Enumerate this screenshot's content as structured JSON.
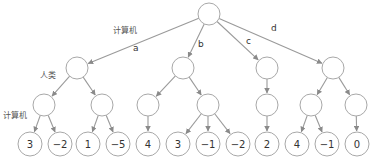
{
  "diagram": {
    "type": "game-tree",
    "level_labels": {
      "root_player": "计算机",
      "level1_player": "人类",
      "level2_player": "计算机"
    },
    "edge_labels": [
      "a",
      "b",
      "c",
      "d"
    ],
    "root": {
      "id": "root",
      "x": 209,
      "y": 14
    },
    "level1": [
      {
        "id": "n_a",
        "x": 77,
        "y": 68,
        "edge": "a"
      },
      {
        "id": "n_b",
        "x": 183,
        "y": 68,
        "edge": "b"
      },
      {
        "id": "n_c",
        "x": 267,
        "y": 68,
        "edge": "c"
      },
      {
        "id": "n_d",
        "x": 333,
        "y": 68,
        "edge": "d"
      }
    ],
    "level2": [
      {
        "id": "n_a1",
        "x": 44,
        "y": 105,
        "parent": 0
      },
      {
        "id": "n_a2",
        "x": 102,
        "y": 105,
        "parent": 0
      },
      {
        "id": "n_b1",
        "x": 148,
        "y": 105,
        "parent": 1
      },
      {
        "id": "n_b2",
        "x": 208,
        "y": 105,
        "parent": 1
      },
      {
        "id": "n_c1",
        "x": 267,
        "y": 105,
        "parent": 2
      },
      {
        "id": "n_d1",
        "x": 311,
        "y": 105,
        "parent": 3
      },
      {
        "id": "n_d2",
        "x": 356,
        "y": 105,
        "parent": 3
      }
    ],
    "leaves": [
      {
        "value": "3",
        "x": 30,
        "y": 144,
        "parent": 0
      },
      {
        "value": "−2",
        "x": 60,
        "y": 144,
        "parent": 0
      },
      {
        "value": "1",
        "x": 88,
        "y": 144,
        "parent": 1
      },
      {
        "value": "−5",
        "x": 118,
        "y": 144,
        "parent": 1
      },
      {
        "value": "4",
        "x": 148,
        "y": 144,
        "parent": 2
      },
      {
        "value": "3",
        "x": 178,
        "y": 144,
        "parent": 3
      },
      {
        "value": "−1",
        "x": 208,
        "y": 144,
        "parent": 3
      },
      {
        "value": "−2",
        "x": 238,
        "y": 144,
        "parent": 3
      },
      {
        "value": "2",
        "x": 267,
        "y": 144,
        "parent": 4
      },
      {
        "value": "4",
        "x": 297,
        "y": 144,
        "parent": 5
      },
      {
        "value": "−1",
        "x": 327,
        "y": 144,
        "parent": 5
      },
      {
        "value": "0",
        "x": 357,
        "y": 144,
        "parent": 6
      }
    ],
    "colors": {
      "node_stroke": "#a8a8a8",
      "edge": "#9a9a9a",
      "text": "#333333"
    }
  }
}
